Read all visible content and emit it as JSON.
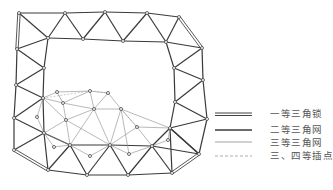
{
  "colors": {
    "first_order": "#444444",
    "second_order": "#3a3a3a",
    "third_order": "#8a8a8a",
    "fourth_order": "#9a9a9a",
    "node_fill": "#ffffff",
    "node_stroke": "#444444"
  },
  "legend": [
    {
      "label": "一等三角锁",
      "style": "double"
    },
    {
      "label": "二等三角网",
      "style": "thick"
    },
    {
      "label": "三等三角网",
      "style": "thin"
    },
    {
      "label": "三、四等插点",
      "style": "dashed"
    }
  ],
  "nodes": {
    "T1": [
      19,
      13
    ],
    "T2": [
      65,
      13
    ],
    "T3": [
      105,
      12
    ],
    "T4": [
      147,
      13
    ],
    "T5": [
      179,
      17
    ],
    "I1": [
      48,
      38
    ],
    "I2": [
      83,
      39
    ],
    "I3": [
      123,
      41
    ],
    "I4": [
      166,
      42
    ],
    "R1": [
      202,
      48
    ],
    "R2": [
      174,
      68
    ],
    "R3": [
      203,
      80
    ],
    "R4": [
      175,
      102
    ],
    "R5": [
      207,
      119
    ],
    "R6": [
      170,
      128
    ],
    "R7": [
      199,
      154
    ],
    "L1": [
      17,
      49
    ],
    "L2": [
      44,
      68
    ],
    "L3": [
      16,
      85
    ],
    "L4": [
      43,
      98
    ],
    "L5": [
      14,
      118
    ],
    "L6": [
      44,
      133
    ],
    "L7": [
      14,
      150
    ],
    "B1": [
      48,
      170
    ],
    "B2": [
      87,
      175
    ],
    "B3": [
      128,
      175
    ],
    "B4": [
      172,
      173
    ],
    "IB1": [
      70,
      145
    ],
    "IB2": [
      110,
      145
    ],
    "IB3": [
      152,
      146
    ],
    "N1": [
      57,
      92
    ],
    "N2": [
      90,
      91
    ],
    "N3": [
      108,
      93
    ],
    "N4": [
      63,
      103
    ],
    "N5": [
      94,
      109
    ],
    "N6": [
      121,
      109
    ],
    "N7": [
      37,
      117
    ],
    "N8": [
      66,
      120
    ],
    "N9": [
      137,
      127
    ],
    "N10": [
      168,
      140
    ],
    "N11": [
      54,
      147
    ],
    "N12": [
      90,
      156
    ],
    "N13": [
      129,
      154
    ]
  },
  "edges_first": [
    [
      "T1",
      "L1"
    ],
    [
      "T5",
      "R1"
    ],
    [
      "L7",
      "B1"
    ],
    [
      "B4",
      "R7"
    ]
  ],
  "edges_second": [
    [
      "T1",
      "T2"
    ],
    [
      "T2",
      "T3"
    ],
    [
      "T3",
      "T4"
    ],
    [
      "T4",
      "T5"
    ],
    [
      "T1",
      "I1"
    ],
    [
      "T2",
      "I1"
    ],
    [
      "T2",
      "I2"
    ],
    [
      "T3",
      "I2"
    ],
    [
      "T3",
      "I3"
    ],
    [
      "T4",
      "I3"
    ],
    [
      "T4",
      "I4"
    ],
    [
      "T5",
      "I4"
    ],
    [
      "I1",
      "I2"
    ],
    [
      "I2",
      "I3"
    ],
    [
      "I3",
      "I4"
    ],
    [
      "I4",
      "R1"
    ],
    [
      "I4",
      "R2"
    ],
    [
      "R1",
      "R2"
    ],
    [
      "R1",
      "R3"
    ],
    [
      "R2",
      "R3"
    ],
    [
      "R2",
      "R4"
    ],
    [
      "R3",
      "R4"
    ],
    [
      "R3",
      "R5"
    ],
    [
      "R4",
      "R5"
    ],
    [
      "R4",
      "R6"
    ],
    [
      "R5",
      "R6"
    ],
    [
      "R5",
      "R7"
    ],
    [
      "R6",
      "R7"
    ],
    [
      "I1",
      "L1"
    ],
    [
      "I1",
      "L2"
    ],
    [
      "L1",
      "L2"
    ],
    [
      "L1",
      "L3"
    ],
    [
      "L2",
      "L3"
    ],
    [
      "L2",
      "L4"
    ],
    [
      "L3",
      "L4"
    ],
    [
      "L3",
      "L5"
    ],
    [
      "L4",
      "L5"
    ],
    [
      "L4",
      "L6"
    ],
    [
      "L5",
      "L6"
    ],
    [
      "L5",
      "L7"
    ],
    [
      "L6",
      "L7"
    ],
    [
      "L6",
      "B1"
    ],
    [
      "L6",
      "IB1"
    ],
    [
      "IB1",
      "B1"
    ],
    [
      "IB1",
      "B2"
    ],
    [
      "B1",
      "B2"
    ],
    [
      "B2",
      "B3"
    ],
    [
      "B3",
      "B4"
    ],
    [
      "IB1",
      "IB2"
    ],
    [
      "IB2",
      "IB3"
    ],
    [
      "IB2",
      "B2"
    ],
    [
      "IB2",
      "B3"
    ],
    [
      "IB3",
      "B3"
    ],
    [
      "IB3",
      "B4"
    ],
    [
      "IB3",
      "R7"
    ],
    [
      "IB3",
      "R6"
    ],
    [
      "R6",
      "B4"
    ],
    [
      "R6",
      "R7"
    ]
  ],
  "edges_third": [
    [
      "L4",
      "N1"
    ],
    [
      "L4",
      "N4"
    ],
    [
      "L4",
      "N8"
    ],
    [
      "L4",
      "N7"
    ],
    [
      "L6",
      "N7"
    ],
    [
      "L6",
      "N8"
    ],
    [
      "N1",
      "N2"
    ],
    [
      "N1",
      "N4"
    ],
    [
      "N2",
      "N3"
    ],
    [
      "N2",
      "N4"
    ],
    [
      "N2",
      "N5"
    ],
    [
      "N3",
      "N5"
    ],
    [
      "N3",
      "N6"
    ],
    [
      "N4",
      "N5"
    ],
    [
      "N4",
      "N8"
    ],
    [
      "N5",
      "N8"
    ],
    [
      "N5",
      "N6"
    ],
    [
      "N8",
      "IB1"
    ],
    [
      "N5",
      "IB1"
    ],
    [
      "N5",
      "IB2"
    ],
    [
      "N6",
      "IB2"
    ],
    [
      "N6",
      "N9"
    ],
    [
      "N6",
      "R6"
    ],
    [
      "N9",
      "IB2"
    ],
    [
      "N9",
      "IB3"
    ],
    [
      "N9",
      "R6"
    ],
    [
      "N6",
      "N13"
    ],
    [
      "L6",
      "IB1"
    ],
    [
      "N11",
      "IB1"
    ],
    [
      "N11",
      "L6"
    ],
    [
      "IB1",
      "N12"
    ],
    [
      "IB2",
      "N12"
    ],
    [
      "IB2",
      "N13"
    ],
    [
      "N13",
      "IB3"
    ],
    [
      "N10",
      "IB3"
    ],
    [
      "N10",
      "R6"
    ],
    [
      "N8",
      "IB2"
    ]
  ],
  "edges_fourth": [
    [
      "N1",
      "N4"
    ],
    [
      "N2",
      "N3"
    ],
    [
      "N6",
      "N9"
    ],
    [
      "L4",
      "N2"
    ]
  ]
}
